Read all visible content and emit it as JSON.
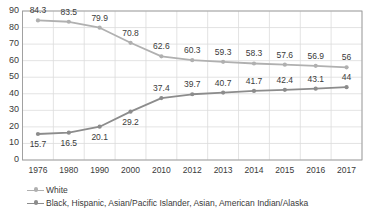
{
  "chart_data": {
    "type": "line",
    "title": "",
    "subtitle": "",
    "xlabel": "",
    "ylabel": "",
    "categories": [
      "1976",
      "1980",
      "1990",
      "2000",
      "2010",
      "2012",
      "2013",
      "2014",
      "2015",
      "2016",
      "2017"
    ],
    "ylim": [
      0,
      90
    ],
    "yticks": [
      "0",
      "10",
      "20",
      "30",
      "40",
      "50",
      "60",
      "70",
      "80",
      "90"
    ],
    "ytick_values": [
      0,
      10,
      20,
      30,
      40,
      50,
      60,
      70,
      80,
      90
    ],
    "grid": true,
    "legend_position": "bottom-left",
    "series": [
      {
        "name": "White",
        "color": "#b0b0b0",
        "marker": "circle",
        "label_position": "above",
        "values": [
          84.3,
          83.5,
          79.9,
          70.8,
          62.6,
          60.3,
          59.3,
          58.3,
          57.6,
          56.9,
          56
        ],
        "labels": [
          "84.3",
          "83.5",
          "79.9",
          "70.8",
          "62.6",
          "60.3",
          "59.3",
          "58.3",
          "57.6",
          "56.9",
          "56"
        ]
      },
      {
        "name": "Black, Hispanic, Asian/Pacific Islander, Asian, American Indian/Alaska",
        "color": "#8c8c8c",
        "marker": "circle",
        "label_position": "mixed",
        "values": [
          15.7,
          16.5,
          20.1,
          29.2,
          37.4,
          39.7,
          40.7,
          41.7,
          42.4,
          43.1,
          44
        ],
        "labels": [
          "15.7",
          "16.5",
          "20.1",
          "29.2",
          "37.4",
          "39.7",
          "40.7",
          "41.7",
          "42.4",
          "43.1",
          "44"
        ]
      }
    ]
  },
  "legend": {
    "items": [
      {
        "label": "White"
      },
      {
        "label": "Black, Hispanic, Asian/Pacific Islander, Asian, American Indian/Alaska"
      }
    ]
  },
  "colors": {
    "series_white": "#b0b0b0",
    "series_minority": "#8c8c8c",
    "grid": "#dcdcdc",
    "axis": "#9a9a9a",
    "text": "#3a3a3a",
    "background": "#ffffff"
  }
}
